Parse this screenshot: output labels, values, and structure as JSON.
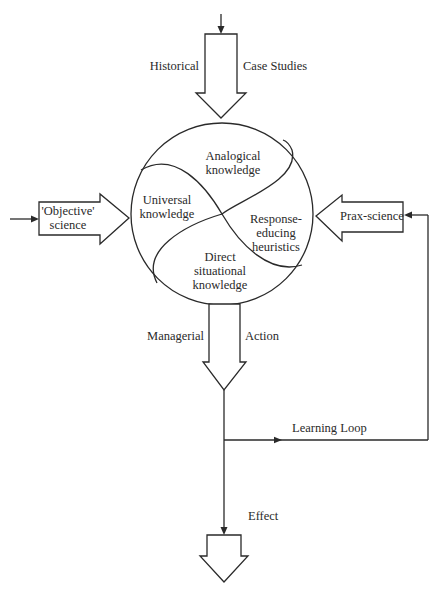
{
  "diagram": {
    "type": "flow-diagram",
    "colors": {
      "stroke": "#2a2a2a",
      "background": "#ffffff"
    },
    "inputs": {
      "top": {
        "left_label": "Historical",
        "right_label": "Case Studies"
      },
      "left": {
        "line1": "'Objective'",
        "line2": "science"
      },
      "right": {
        "label": "Prax-science"
      }
    },
    "circle": {
      "regions": {
        "analogical": {
          "line1": "Analogical",
          "line2": "knowledge"
        },
        "universal": {
          "line1": "Universal",
          "line2": "knowledge"
        },
        "response": {
          "line1": "Response-",
          "line2": "educing",
          "line3": "heuristics"
        },
        "direct": {
          "line1": "Direct",
          "line2": "situational",
          "line3": "knowledge"
        }
      }
    },
    "output": {
      "left_label": "Managerial",
      "right_label": "Action"
    },
    "loop": {
      "label": "Learning Loop"
    },
    "effect": {
      "label": "Effect"
    }
  }
}
